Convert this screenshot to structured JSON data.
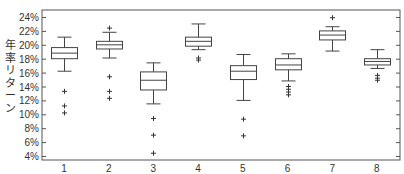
{
  "chart_data": {
    "type": "box",
    "title": "",
    "xlabel": "",
    "ylabel": "年率リターン",
    "categories": [
      "1",
      "2",
      "3",
      "4",
      "5",
      "6",
      "7",
      "8"
    ],
    "yticks": [
      "4%",
      "6%",
      "8%",
      "10%",
      "12%",
      "14%",
      "16%",
      "18%",
      "20%",
      "22%",
      "24%"
    ],
    "ylim": [
      4,
      24
    ],
    "grid": false,
    "boxes": [
      {
        "label": "1",
        "whisker_low": 16.2,
        "q1": 18.0,
        "median": 18.8,
        "q3": 19.6,
        "whisker_high": 21.1,
        "outliers": [
          13.3,
          11.2,
          10.2
        ]
      },
      {
        "label": "2",
        "whisker_low": 18.1,
        "q1": 19.4,
        "median": 20.0,
        "q3": 20.5,
        "whisker_high": 21.8,
        "outliers": [
          22.4,
          15.4,
          13.3,
          12.3
        ]
      },
      {
        "label": "3",
        "whisker_low": 11.5,
        "q1": 13.5,
        "median": 14.9,
        "q3": 16.1,
        "whisker_high": 17.4,
        "outliers": [
          9.4,
          7.0,
          4.4
        ]
      },
      {
        "label": "4",
        "whisker_low": 19.3,
        "q1": 19.8,
        "median": 20.5,
        "q3": 21.1,
        "whisker_high": 23.0,
        "outliers": [
          18.1,
          17.8
        ]
      },
      {
        "label": "5",
        "whisker_low": 12.0,
        "q1": 15.0,
        "median": 16.2,
        "q3": 17.0,
        "whisker_high": 18.6,
        "outliers": [
          9.3,
          6.9
        ]
      },
      {
        "label": "6",
        "whisker_low": 14.8,
        "q1": 16.4,
        "median": 17.1,
        "q3": 18.0,
        "whisker_high": 18.7,
        "outliers": [
          14.0,
          13.6,
          13.2,
          12.8
        ]
      },
      {
        "label": "7",
        "whisker_low": 19.1,
        "q1": 20.7,
        "median": 21.4,
        "q3": 22.0,
        "whisker_high": 22.6,
        "outliers": [
          23.9
        ]
      },
      {
        "label": "8",
        "whisker_low": 16.6,
        "q1": 17.1,
        "median": 17.6,
        "q3": 18.0,
        "whisker_high": 19.3,
        "outliers": [
          15.6,
          15.2,
          14.9
        ]
      }
    ],
    "colors": {
      "box": "#444444",
      "axis": "#555555",
      "outlier": "#333333"
    }
  }
}
